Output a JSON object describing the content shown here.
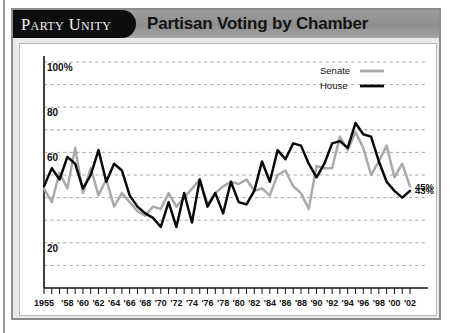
{
  "header": {
    "tab_label": "Party Unity",
    "title": "Partisan Voting by Chamber"
  },
  "legend": {
    "position": "top-right",
    "items": [
      {
        "label": "Senate",
        "color": "#a9a9a9"
      },
      {
        "label": "House",
        "color": "#0a0a0a"
      }
    ]
  },
  "end_labels": [
    {
      "label": "45%",
      "series": "Senate"
    },
    {
      "label": "43%",
      "series": "House"
    }
  ],
  "chart_data": {
    "type": "line",
    "title": "Partisan Voting by Chamber",
    "xlabel": "",
    "ylabel": "",
    "ylim": [
      0,
      100
    ],
    "xlim": [
      1955,
      2002
    ],
    "grid": true,
    "y_ticks": [
      0,
      10,
      20,
      30,
      40,
      50,
      60,
      70,
      80,
      90,
      100
    ],
    "y_tick_labels": [
      "",
      "",
      "20",
      "",
      "",
      "",
      "60",
      "",
      "80",
      "",
      "100%"
    ],
    "x_tick_labels": [
      "1955",
      "'58",
      "'60",
      "'62",
      "'64",
      "'66",
      "'68",
      "'70",
      "'72",
      "'74",
      "'76",
      "'78",
      "'80",
      "'82",
      "'84",
      "'86",
      "'88",
      "'90",
      "'92",
      "'94",
      "'96",
      "'98",
      "'00",
      "'02"
    ],
    "x_label_years": [
      1955,
      1958,
      1960,
      1962,
      1964,
      1966,
      1968,
      1970,
      1972,
      1974,
      1976,
      1978,
      1980,
      1982,
      1984,
      1986,
      1988,
      1990,
      1992,
      1994,
      1996,
      1998,
      2000,
      2002
    ],
    "x": [
      1955,
      1956,
      1957,
      1958,
      1959,
      1960,
      1961,
      1962,
      1963,
      1964,
      1965,
      1966,
      1967,
      1968,
      1969,
      1970,
      1971,
      1972,
      1973,
      1974,
      1975,
      1976,
      1977,
      1978,
      1979,
      1980,
      1981,
      1982,
      1983,
      1984,
      1985,
      1986,
      1987,
      1988,
      1989,
      1990,
      1991,
      1992,
      1993,
      1994,
      1995,
      1996,
      1997,
      1998,
      1999,
      2000,
      2001,
      2002
    ],
    "series": [
      {
        "name": "House",
        "color": "#0a0a0a",
        "values": [
          45,
          53,
          48,
          58,
          55,
          44,
          50,
          61,
          47,
          55,
          52,
          41,
          36,
          33,
          31,
          27,
          38,
          27,
          42,
          29,
          48,
          36,
          42,
          33,
          47,
          38,
          37,
          43,
          56,
          47,
          61,
          57,
          64,
          63,
          55,
          49,
          55,
          64,
          65,
          62,
          73,
          68,
          67,
          56,
          47,
          43,
          40,
          43
        ]
      },
      {
        "name": "Senate",
        "color": "#a9a9a9",
        "values": [
          44,
          38,
          51,
          44,
          62,
          42,
          53,
          41,
          48,
          36,
          42,
          38,
          34,
          32,
          36,
          35,
          42,
          36,
          40,
          44,
          48,
          37,
          42,
          45,
          47,
          46,
          48,
          43,
          44,
          41,
          50,
          52,
          45,
          42,
          35,
          54,
          53,
          53,
          67,
          61,
          69,
          62,
          50,
          56,
          63,
          49,
          55,
          45
        ]
      }
    ],
    "annotations": [
      {
        "text": "45%",
        "series": "Senate",
        "x": 2002,
        "y": 45
      },
      {
        "text": "43%",
        "series": "House",
        "x": 2002,
        "y": 43
      }
    ]
  }
}
